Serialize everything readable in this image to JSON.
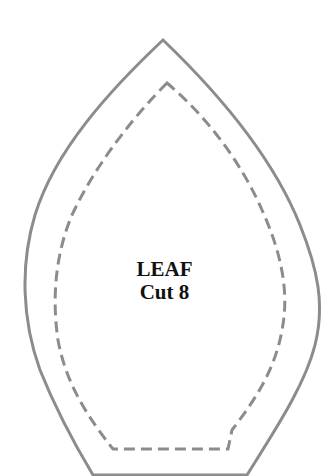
{
  "pattern": {
    "name": "LEAF",
    "instruction": "Cut 8",
    "colors": {
      "outline": "#8c8c8c",
      "text": "#111111",
      "background": "#ffffff"
    }
  }
}
